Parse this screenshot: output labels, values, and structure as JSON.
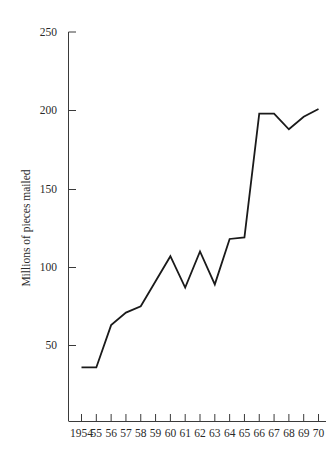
{
  "chart_data": {
    "type": "line",
    "title": "",
    "subtitle": "",
    "xlabel": "",
    "ylabel": "Millions of pieces mailed",
    "x": [
      1954,
      1955,
      1956,
      1957,
      1958,
      1959,
      1960,
      1961,
      1962,
      1963,
      1964,
      1965,
      1966,
      1967,
      1968,
      1969,
      1970
    ],
    "x_tick_labels": [
      "1954",
      "55",
      "56",
      "57",
      "58",
      "59",
      "60",
      "61",
      "62",
      "63",
      "64",
      "65",
      "66",
      "67",
      "68",
      "69",
      "70"
    ],
    "values": [
      36,
      36,
      63,
      71,
      75,
      91,
      107,
      87,
      110,
      89,
      118,
      119,
      198,
      198,
      188,
      196,
      201
    ],
    "series": [
      {
        "name": "Millions of pieces mailed",
        "values": [
          36,
          36,
          63,
          71,
          75,
          91,
          107,
          87,
          110,
          89,
          118,
          119,
          198,
          198,
          188,
          196,
          201
        ]
      }
    ],
    "y_tick_labels": [
      "250",
      "200",
      "150",
      "100",
      "50"
    ],
    "y_ticks": [
      250,
      200,
      150,
      100,
      50
    ],
    "ylim": [
      0,
      250
    ],
    "xlim": [
      1954,
      1970
    ],
    "grid": false,
    "legend": "none",
    "line_color": "#1a1a1a",
    "axis_color": "#3a3a3a",
    "background_color": "#ffffff"
  },
  "axes": {
    "y_title": "Millions of pieces mailed",
    "y_labels": [
      "250",
      "200",
      "150",
      "100",
      "50"
    ],
    "x_labels": [
      "1954",
      "55",
      "56",
      "57",
      "58",
      "59",
      "60",
      "61",
      "62",
      "63",
      "64",
      "65",
      "66",
      "67",
      "68",
      "69",
      "70"
    ]
  }
}
